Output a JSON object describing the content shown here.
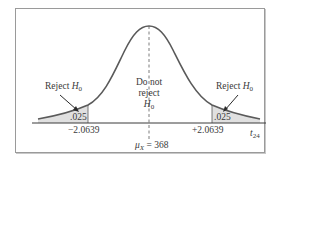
{
  "diagram": {
    "type": "two-tailed t-test rejection regions",
    "distribution": "t",
    "degrees_of_freedom_label": "t",
    "degrees_of_freedom_sub": "24",
    "center": {
      "symbol": "μ",
      "symbol_sub": "X",
      "equals": " = ",
      "value": "368"
    },
    "left_region": {
      "label_text": "Reject ",
      "label_h": "H",
      "label_sub": "0",
      "area": ".025",
      "critical_value": "−2.0639"
    },
    "right_region": {
      "label_text": "Reject ",
      "label_h": "H",
      "label_sub": "0",
      "area": ".025",
      "critical_value": "+2.0639"
    },
    "middle_region": {
      "line1": "Do not",
      "line2": "reject",
      "label_h": "H",
      "label_sub": "0"
    },
    "colors": {
      "curve": "#5a5a5a",
      "shade": "#e0e0e0",
      "axis": "#3a3a3a",
      "frame": "#9a9a9a"
    }
  }
}
